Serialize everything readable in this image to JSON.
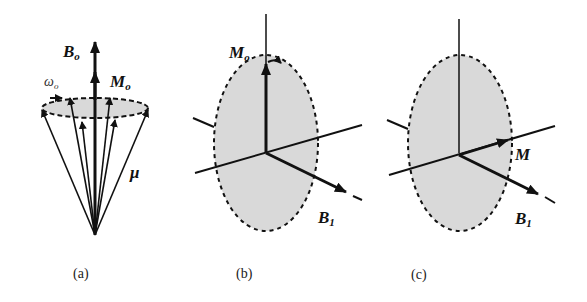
{
  "panels": [
    {
      "id": "a",
      "caption": "(a)",
      "labels": {
        "field": "B",
        "field_sub": "o",
        "magnetization": "M",
        "mag_sub": "o",
        "frequency": "ω",
        "freq_sub": "o",
        "moment": "μ"
      }
    },
    {
      "id": "b",
      "caption": "(b)",
      "labels": {
        "magnetization": "M",
        "mag_sub": "o",
        "rf_field": "B",
        "rf_sub": "1"
      }
    },
    {
      "id": "c",
      "caption": "(c)",
      "labels": {
        "magnetization": "M",
        "rf_field": "B",
        "rf_sub": "1"
      }
    }
  ],
  "colors": {
    "ink": "#111111",
    "fill": "#d9d9d9"
  }
}
